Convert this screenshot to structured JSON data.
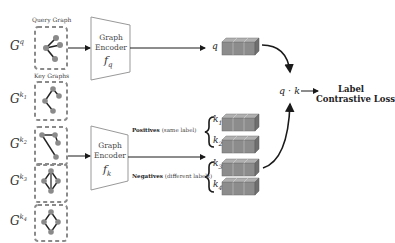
{
  "diagram": {
    "query_section": {
      "title": "Query Graph",
      "symbol": "G",
      "superscript": "q"
    },
    "key_section": {
      "title": "Key Graphs",
      "graphs": [
        {
          "symbol": "G",
          "superscript": "k",
          "index": "1"
        },
        {
          "symbol": "G",
          "superscript": "k",
          "index": "2"
        },
        {
          "symbol": "G",
          "superscript": "k",
          "index": "3"
        },
        {
          "symbol": "G",
          "superscript": "k",
          "index": "4"
        }
      ]
    },
    "encoders": {
      "query": {
        "line1": "Graph",
        "line2": "Encoder",
        "func": "f",
        "sub": "q"
      },
      "key": {
        "line1": "Graph",
        "line2": "Encoder",
        "func": "f",
        "sub": "k"
      }
    },
    "embeddings": {
      "query": {
        "label": "q"
      },
      "keys": [
        {
          "label": "k",
          "index": "1"
        },
        {
          "label": "k",
          "index": "2"
        },
        {
          "label": "k",
          "index": "3"
        },
        {
          "label": "k",
          "index": "4"
        }
      ]
    },
    "groups": {
      "positives": {
        "bold": "Positives",
        "note": "(same label)"
      },
      "negatives": {
        "bold": "Negatives",
        "note": "(different labels)"
      }
    },
    "similarity": {
      "expr": "q · k"
    },
    "loss": {
      "line1": "Label",
      "line2": "Contrastive Loss"
    },
    "colors": {
      "cube_front": "#8c8c8c",
      "cube_top": "#b0b0b0",
      "cube_side": "#6f6f6f",
      "graph_node": "#8a8a8a",
      "dash_box": "#8a8a8a",
      "arrow": "#1a1a1a"
    }
  }
}
